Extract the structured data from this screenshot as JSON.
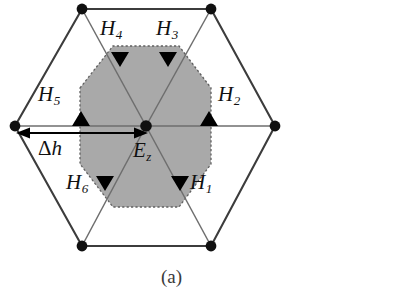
{
  "figure": {
    "caption": "(a)",
    "colors": {
      "inner_hexagon_fill": "#a9a9a9",
      "inner_hexagon_border": "#5a5a5a",
      "outer_hexagon_stroke": "#3c3c3c",
      "spoke_stroke": "#6e6e6e",
      "node_fill": "#101010",
      "arrow_fill": "#000000",
      "label_color": "#111111",
      "background": "#ffffff"
    }
  },
  "labels": {
    "h1": {
      "base": "H",
      "sub": "1"
    },
    "h2": {
      "base": "H",
      "sub": "2"
    },
    "h3": {
      "base": "H",
      "sub": "3"
    },
    "h4": {
      "base": "H",
      "sub": "4"
    },
    "h5": {
      "base": "H",
      "sub": "5"
    },
    "h6": {
      "base": "H",
      "sub": "6"
    },
    "ez": {
      "base": "E",
      "sub": "z"
    },
    "delta_h": {
      "delta": "Δ",
      "base": "h"
    }
  },
  "geometry": {
    "outer_hexagon_vertices": [
      [
        82,
        9
      ],
      [
        211,
        9
      ],
      [
        275,
        126
      ],
      [
        211,
        246
      ],
      [
        82,
        246
      ],
      [
        15,
        126
      ]
    ],
    "inner_hexagon_vertices": [
      [
        80,
        88
      ],
      [
        113,
        46
      ],
      [
        179,
        46
      ],
      [
        211,
        88
      ],
      [
        211,
        164
      ],
      [
        179,
        207
      ],
      [
        113,
        207
      ],
      [
        80,
        164
      ]
    ],
    "center_node": [
      146,
      126
    ],
    "delta_h_arrow": {
      "x1": 18,
      "x2": 146,
      "y": 133
    },
    "field_arrows": [
      {
        "name": "h1",
        "x": 179,
        "y": 182,
        "direction": "down"
      },
      {
        "name": "h2",
        "x": 208,
        "y": 119,
        "direction": "up"
      },
      {
        "name": "h3",
        "x": 168,
        "y": 59,
        "direction": "down"
      },
      {
        "name": "h4",
        "x": 120,
        "y": 59,
        "direction": "down"
      },
      {
        "name": "h5",
        "x": 81,
        "y": 119,
        "direction": "up"
      },
      {
        "name": "h6",
        "x": 105,
        "y": 182,
        "direction": "down"
      }
    ]
  }
}
